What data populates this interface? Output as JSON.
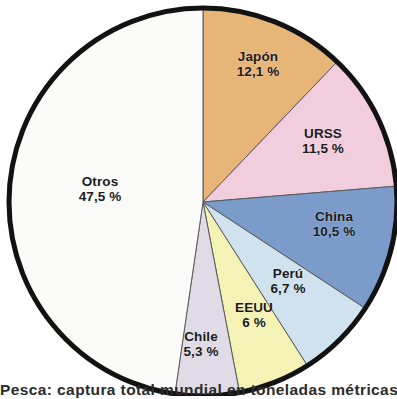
{
  "chart_data": {
    "type": "pie",
    "title": "",
    "caption": "Pesca: captura total mundial en toneladas métricas",
    "unit": "%",
    "center": {
      "x": 203,
      "y": 202
    },
    "radius": 194,
    "start_angle_deg": 0,
    "direction": "clockwise",
    "outline_color": "#121212",
    "outline_width": 5,
    "legend": "none",
    "labels_inside": true,
    "categories": [
      "Japón",
      "URSS",
      "China",
      "Perú",
      "EEUU",
      "Chile",
      "Otros"
    ],
    "values": [
      12.1,
      11.5,
      10.5,
      6.7,
      6,
      5.3,
      47.5
    ],
    "value_text": [
      "12,1 %",
      "11,5 %",
      "10,5 %",
      "6,7 %",
      "6 %",
      "5,3 %",
      "47,5 %"
    ],
    "colors": [
      "#e8b579",
      "#f2cddd",
      "#7b9ccb",
      "#cfe2ee",
      "#f4f2b4",
      "#e0dbe6",
      "#fbfbf9"
    ],
    "slices": [
      {
        "name": "Japón",
        "value": 12.1,
        "value_text": "12,1 %",
        "color": "#e8b579",
        "label_x": 258,
        "label_y": 64
      },
      {
        "name": "URSS",
        "value": 11.5,
        "value_text": "11,5 %",
        "color": "#f2cddd",
        "label_x": 323,
        "label_y": 141
      },
      {
        "name": "China",
        "value": 10.5,
        "value_text": "10,5 %",
        "color": "#7b9ccb",
        "label_x": 334,
        "label_y": 224
      },
      {
        "name": "Perú",
        "value": 6.7,
        "value_text": "6,7 %",
        "color": "#cfe2ee",
        "label_x": 288,
        "label_y": 281
      },
      {
        "name": "EEUU",
        "value": 6,
        "value_text": "6 %",
        "color": "#f4f2b4",
        "label_x": 254,
        "label_y": 315
      },
      {
        "name": "Chile",
        "value": 5.3,
        "value_text": "5,3 %",
        "color": "#e0dbe6",
        "label_x": 201,
        "label_y": 344
      },
      {
        "name": "Otros",
        "value": 47.5,
        "value_text": "47,5 %",
        "color": "#fbfbf9",
        "label_x": 100,
        "label_y": 189
      }
    ]
  }
}
